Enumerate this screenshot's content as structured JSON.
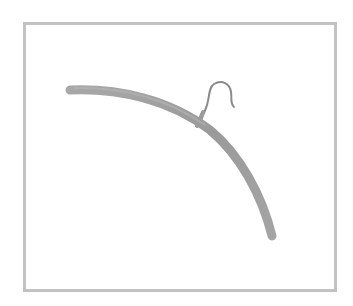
{
  "image": {
    "subject": "wooden clothes hanger",
    "description": "Curved gray wooden hanger with a metal hook, inside a thin gray rectangular frame on white background"
  },
  "colors": {
    "background": "#ffffff",
    "frame_border": "#c2c2c2",
    "hanger_bar": "#9e9e9e",
    "hanger_bar_highlight": "#b4b4b4",
    "hook": "#8a8a8a"
  }
}
